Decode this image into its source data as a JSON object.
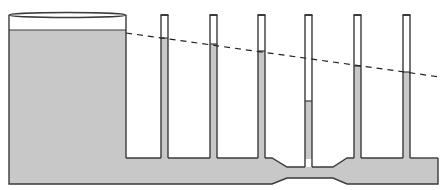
{
  "diagram": {
    "type": "bernoulli-venturi-piezometer",
    "colors": {
      "water": "#c8c8c8",
      "outline": "#3a3a3a",
      "background": "#ffffff",
      "dashed_line": "#222222"
    },
    "tank": {
      "x_left": 9,
      "x_right": 126,
      "top_y": 15,
      "water_y": 30,
      "bottom_y": 184
    },
    "pipe": {
      "top_y": 158,
      "bottom_y": 184,
      "right_x": 438,
      "constriction": {
        "start_x": 272,
        "narrow_start_x": 287,
        "narrow_end_x": 333,
        "end_x": 347,
        "top_y": 167,
        "bottom_y": 178
      }
    },
    "tubes": [
      {
        "x": 161,
        "width": 7,
        "top_y": 15,
        "water_y": 38
      },
      {
        "x": 210,
        "width": 7,
        "top_y": 15,
        "water_y": 44
      },
      {
        "x": 258,
        "width": 7,
        "top_y": 15,
        "water_y": 51
      },
      {
        "x": 305,
        "width": 7,
        "top_y": 15,
        "water_y": 101
      },
      {
        "x": 354,
        "width": 7,
        "top_y": 15,
        "water_y": 66
      },
      {
        "x": 403,
        "width": 7,
        "top_y": 15,
        "water_y": 72
      }
    ],
    "energy_line": {
      "x1": 126,
      "y1": 33,
      "x2": 440,
      "y2": 77
    }
  }
}
